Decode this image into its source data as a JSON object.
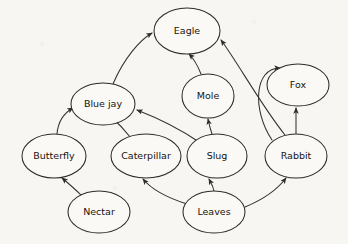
{
  "diagram": {
    "background_color": "#f7f6f3",
    "node_fill_color": "#faf9f6",
    "node_stroke_color": "#2e2c2a",
    "edge_color": "#33312f",
    "width": 348,
    "height": 244
  },
  "nodes": [
    {
      "id": "eagle",
      "label": "Eagle",
      "cx": 187,
      "cy": 31,
      "rx": 33,
      "ry": 23
    },
    {
      "id": "bluejay",
      "label": "Blue jay",
      "cx": 103,
      "cy": 104,
      "rx": 32,
      "ry": 21
    },
    {
      "id": "mole",
      "label": "Mole",
      "cx": 208,
      "cy": 96,
      "rx": 26,
      "ry": 22
    },
    {
      "id": "fox",
      "label": "Fox",
      "cx": 298,
      "cy": 85,
      "rx": 31,
      "ry": 21
    },
    {
      "id": "butterfly",
      "label": "Butterfly",
      "cx": 54,
      "cy": 156,
      "rx": 32,
      "ry": 22
    },
    {
      "id": "caterpillar",
      "label": "Caterpillar",
      "cx": 146,
      "cy": 156,
      "rx": 35,
      "ry": 22
    },
    {
      "id": "slug",
      "label": "Slug",
      "cx": 217,
      "cy": 156,
      "rx": 30,
      "ry": 22
    },
    {
      "id": "rabbit",
      "label": "Rabbit",
      "cx": 296,
      "cy": 156,
      "rx": 31,
      "ry": 22
    },
    {
      "id": "nectar",
      "label": "Nectar",
      "cx": 99,
      "cy": 212,
      "rx": 31,
      "ry": 21
    },
    {
      "id": "leaves",
      "label": "Leaves",
      "cx": 214,
      "cy": 212,
      "rx": 31,
      "ry": 21
    }
  ],
  "edges": [
    {
      "id": "bluejay-eagle",
      "from": "bluejay",
      "to": "eagle",
      "label": "Blue jay eaten by Eagle",
      "path": "M 113 84 C 124 58, 140 40, 152 33"
    },
    {
      "id": "mole-eagle",
      "from": "mole",
      "to": "eagle",
      "label": "Mole eaten by Eagle",
      "path": "M 201 74 C 197 64, 193 58, 189 54"
    },
    {
      "id": "rabbit-eagle",
      "from": "rabbit",
      "to": "eagle",
      "label": "Rabbit eaten by Eagle",
      "path": "M 285 135 C 261 105, 238 63, 221 40"
    },
    {
      "id": "rabbit-fox",
      "from": "rabbit",
      "to": "fox",
      "label": "Rabbit eaten by Fox",
      "path": "M 296 134 C 296 122, 296 115, 296 108"
    },
    {
      "id": "rabbit-fox-curve",
      "from": "rabbit",
      "to": "fox",
      "label": "Rabbit to Fox upper curve",
      "path": "M 272 140 C 252 110, 254 68, 280 68"
    },
    {
      "id": "slug-mole",
      "from": "slug",
      "to": "mole",
      "label": "Slug eaten by Mole",
      "path": "M 212 134 C 210 128, 209 124, 208 119"
    },
    {
      "id": "slug-bluejay",
      "from": "slug",
      "to": "bluejay",
      "label": "Slug eaten by Blue jay",
      "path": "M 199 142 C 180 129, 155 117, 137 110"
    },
    {
      "id": "caterpillar-bluejay",
      "from": "caterpillar",
      "to": "bluejay",
      "label": "Caterpillar eaten by Blue jay",
      "path": "M 131 138 C 124 129, 117 122, 110 116"
    },
    {
      "id": "butterfly-bluejay",
      "from": "butterfly",
      "to": "bluejay",
      "label": "Butterfly eaten by Blue jay",
      "path": "M 57 134 C 58 122, 64 113, 73 108"
    },
    {
      "id": "nectar-butterfly",
      "from": "nectar",
      "to": "butterfly",
      "label": "Nectar eaten by Butterfly",
      "path": "M 82 196 C 74 188, 68 183, 62 178"
    },
    {
      "id": "leaves-caterpillar",
      "from": "leaves",
      "to": "caterpillar",
      "label": "Leaves eaten by Caterpillar",
      "path": "M 187 204 C 168 198, 152 190, 143 179"
    },
    {
      "id": "leaves-slug",
      "from": "leaves",
      "to": "slug",
      "label": "Leaves eaten by Slug",
      "path": "M 214 191 C 213 186, 211 183, 209 179"
    },
    {
      "id": "leaves-rabbit",
      "from": "leaves",
      "to": "rabbit",
      "label": "Leaves eaten by Rabbit",
      "path": "M 245 207 C 262 200, 277 190, 286 178"
    }
  ]
}
